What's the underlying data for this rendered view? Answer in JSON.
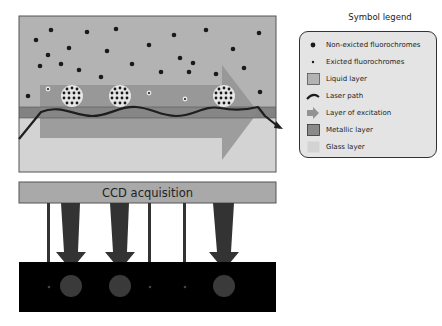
{
  "diagram": {
    "ccd_label": "CCD acquisition",
    "colors": {
      "liquid_layer": "#b3b3b3",
      "metallic_layer": "#8a8a8a",
      "glass_layer": "#d3d3d3",
      "excitation_arrow": "#939393",
      "laser_path": "#1e1e1e",
      "ccd_bar": "#a9a9a9",
      "detector_panel": "#000000",
      "emission_arrows": "#333333",
      "fluorochrome": "#1a1a1a"
    }
  },
  "legend": {
    "title": "Symbol legend",
    "items": [
      {
        "label": "Non-exicted fluorochromes",
        "icon": "large-dot-icon"
      },
      {
        "label": "Exicted fluorochromes",
        "icon": "small-dot-icon"
      },
      {
        "label": "Liquid layer",
        "icon": "liquid-swatch-icon"
      },
      {
        "label": "Laser path",
        "icon": "laser-curve-icon"
      },
      {
        "label": "Layer of excitation",
        "icon": "arrow-right-icon"
      },
      {
        "label": "Metallic layer",
        "icon": "metallic-swatch-icon"
      },
      {
        "label": "Glass layer",
        "icon": "glass-swatch-icon"
      }
    ]
  }
}
